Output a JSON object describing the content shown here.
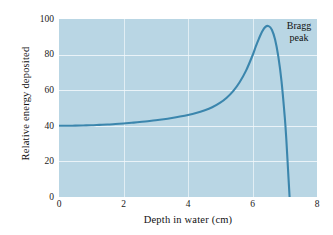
{
  "chart_data": {
    "type": "line",
    "title": "",
    "subtitle": "",
    "xlabel": "Depth in water (cm)",
    "ylabel": "Relative energy deposited",
    "xlim": [
      0,
      8
    ],
    "ylim": [
      0,
      100
    ],
    "xticks": [
      0,
      2,
      4,
      6,
      8
    ],
    "yticks": [
      0,
      20,
      40,
      60,
      80,
      100
    ],
    "xtick_labels": [
      "0",
      "2",
      "4",
      "6",
      "8"
    ],
    "ytick_labels": [
      "0",
      "20",
      "40",
      "60",
      "80",
      "100"
    ],
    "grid": true,
    "grid_color": "#f2f8fb",
    "plot_background": "#b9d6e4",
    "legend": null,
    "series": [
      {
        "name": "Proton depth-dose curve",
        "color": "#3b86ad",
        "x": [
          0.0,
          0.25,
          0.5,
          0.75,
          1.0,
          1.25,
          1.5,
          1.75,
          2.0,
          2.25,
          2.5,
          2.75,
          3.0,
          3.25,
          3.5,
          3.75,
          4.0,
          4.25,
          4.5,
          4.75,
          5.0,
          5.2,
          5.4,
          5.6,
          5.8,
          6.0,
          6.1,
          6.2,
          6.3,
          6.4,
          6.5,
          6.6,
          6.7,
          6.8,
          6.9,
          7.0,
          7.05,
          7.1,
          7.15
        ],
        "y": [
          40.0,
          40.0,
          40.1,
          40.2,
          40.3,
          40.5,
          40.7,
          41.0,
          41.3,
          41.7,
          42.1,
          42.6,
          43.1,
          43.7,
          44.4,
          45.2,
          46.1,
          47.2,
          48.6,
          50.4,
          53.0,
          55.8,
          59.5,
          64.5,
          71.0,
          79.5,
          84.5,
          89.0,
          93.0,
          95.6,
          96.0,
          94.0,
          88.5,
          79.0,
          65.0,
          45.0,
          32.0,
          16.0,
          0.0
        ]
      }
    ],
    "annotations": [
      {
        "text_line1": "Bragg",
        "text_line2": "peak",
        "x": 6.9,
        "y": 97
      }
    ]
  },
  "annotation": {
    "line1": "Bragg",
    "line2": "peak"
  },
  "axes": {
    "x_title": "Depth in water (cm)",
    "y_title": "Relative energy deposited"
  }
}
